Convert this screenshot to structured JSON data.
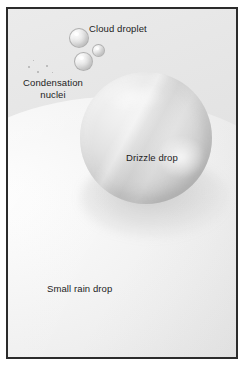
{
  "figure": {
    "frame_border_color": "#2b2b2b",
    "background_color": "#ffffff"
  },
  "labels": {
    "cloud_droplet": "Cloud droplet",
    "condensation_nuclei": "Condensation\nnuclei",
    "drizzle_drop": "Drizzle drop",
    "small_rain_drop": "Small rain drop"
  },
  "elements": {
    "cloud_droplets": [
      {
        "name": "cloud-droplet-large",
        "size_px": 20
      },
      {
        "name": "cloud-droplet-small",
        "size_px": 13
      },
      {
        "name": "cloud-droplet-medium",
        "size_px": 19
      }
    ],
    "condensation_nuclei_specks": [
      {
        "name": "nucleus-1",
        "size_px": 2
      },
      {
        "name": "nucleus-2",
        "size_px": 2
      },
      {
        "name": "nucleus-3",
        "size_px": 2
      },
      {
        "name": "nucleus-4",
        "size_px": 1
      },
      {
        "name": "nucleus-5",
        "size_px": 1
      }
    ],
    "drizzle_drop": {
      "name": "drizzle-drop-sphere",
      "diameter_px": 132
    },
    "small_rain_drop": {
      "name": "small-rain-drop-surface",
      "diameter_px": 560
    }
  },
  "colors": {
    "text": "#1c1c1c",
    "frame": "#2b2b2b",
    "sky_light": "#ebebeb",
    "sky_dark": "#dcdcdc",
    "drop_light": "#f4f4f4",
    "drop_mid": "#d4d4d4",
    "drop_dark": "#a6a6a6"
  }
}
